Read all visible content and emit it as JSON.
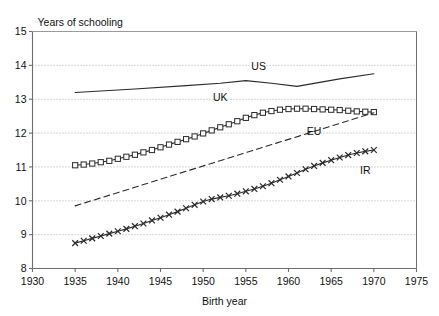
{
  "chart_data": {
    "type": "line",
    "title": "",
    "ylabel": "Years of schooling",
    "xlabel": "Birth year",
    "xlim": [
      1930,
      1975
    ],
    "ylim": [
      8,
      15
    ],
    "xticks": [
      1930,
      1935,
      1940,
      1945,
      1950,
      1955,
      1960,
      1965,
      1970,
      1975
    ],
    "yticks": [
      8,
      9,
      10,
      11,
      12,
      13,
      14,
      15
    ],
    "grid": "horizontal-dotted",
    "legend": "inline-annotations",
    "series": [
      {
        "name": "US",
        "label": "US",
        "style": "solid-line",
        "marker": "none",
        "label_x": 1956.5,
        "label_y": 13.85,
        "x": [
          1935,
          1942,
          1948,
          1952,
          1955,
          1958,
          1961,
          1966,
          1970
        ],
        "values": [
          13.2,
          13.3,
          13.4,
          13.47,
          13.55,
          13.47,
          13.38,
          13.6,
          13.75
        ]
      },
      {
        "name": "UK",
        "label": "UK",
        "style": "solid-line",
        "marker": "square",
        "label_x": 1952.0,
        "label_y": 12.95,
        "x": [
          1935,
          1936,
          1937,
          1938,
          1939,
          1940,
          1941,
          1942,
          1943,
          1944,
          1945,
          1946,
          1947,
          1948,
          1949,
          1950,
          1951,
          1952,
          1953,
          1954,
          1955,
          1956,
          1957,
          1958,
          1959,
          1960,
          1961,
          1962,
          1963,
          1964,
          1965,
          1966,
          1967,
          1968,
          1969,
          1970
        ],
        "values": [
          11.05,
          11.07,
          11.1,
          11.14,
          11.18,
          11.24,
          11.3,
          11.36,
          11.43,
          11.5,
          11.58,
          11.66,
          11.74,
          11.82,
          11.9,
          11.99,
          12.08,
          12.17,
          12.26,
          12.35,
          12.45,
          12.53,
          12.6,
          12.65,
          12.69,
          12.71,
          12.72,
          12.72,
          12.71,
          12.7,
          12.69,
          12.68,
          12.66,
          12.64,
          12.63,
          12.62
        ]
      },
      {
        "name": "EU",
        "label": "EU",
        "style": "dashed-line",
        "marker": "none",
        "label_x": 1963.0,
        "label_y": 11.95,
        "x": [
          1935,
          1970
        ],
        "values": [
          9.85,
          12.6
        ]
      },
      {
        "name": "IR",
        "label": "IR",
        "style": "solid-line",
        "marker": "cross",
        "label_x": 1969.0,
        "label_y": 10.78,
        "x": [
          1935,
          1936,
          1937,
          1938,
          1939,
          1940,
          1941,
          1942,
          1943,
          1944,
          1945,
          1946,
          1947,
          1948,
          1949,
          1950,
          1951,
          1952,
          1953,
          1954,
          1955,
          1956,
          1957,
          1958,
          1959,
          1960,
          1961,
          1962,
          1963,
          1964,
          1965,
          1966,
          1967,
          1968,
          1969,
          1970
        ],
        "values": [
          8.75,
          8.82,
          8.89,
          8.96,
          9.03,
          9.1,
          9.17,
          9.25,
          9.33,
          9.42,
          9.5,
          9.59,
          9.68,
          9.78,
          9.88,
          9.98,
          10.05,
          10.1,
          10.15,
          10.21,
          10.28,
          10.35,
          10.43,
          10.52,
          10.62,
          10.72,
          10.82,
          10.93,
          11.03,
          11.12,
          11.2,
          11.28,
          11.35,
          11.41,
          11.46,
          11.5
        ]
      }
    ],
    "colors": {
      "line": "#2b2b2b",
      "grid": "#9a9a9a",
      "axis": "#6e6e6e",
      "text": "#111111",
      "background": "#ffffff"
    }
  }
}
